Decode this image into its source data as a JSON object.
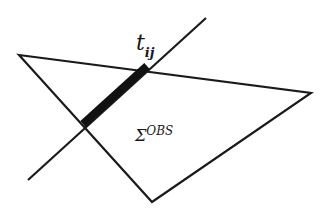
{
  "diagram": {
    "labels": {
      "line_label_main": "t",
      "line_label_sub": "ij",
      "surface_label_symbol": "Σ",
      "surface_label_sup": "OBS"
    },
    "colors": {
      "stroke": "#1a1a1a",
      "background": "#ffffff"
    },
    "triangle": {
      "points": "19,55 311,93 152,202"
    },
    "line": {
      "x1": 28,
      "y1": 180,
      "x2": 206,
      "y2": 18
    },
    "thick_segment": {
      "x1": 83,
      "y1": 124,
      "x2": 147,
      "y2": 66
    }
  }
}
